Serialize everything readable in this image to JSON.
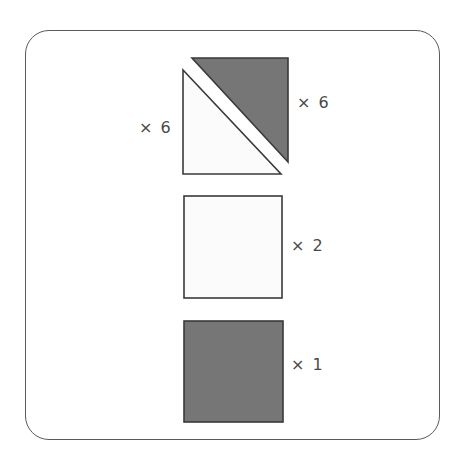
{
  "figure": {
    "frame": {
      "name": "rounded-panel",
      "border_color": "#5a5a5a",
      "background_color": "#ffffff",
      "corner_radius": 24
    },
    "colors": {
      "dark_fill": "#767676",
      "light_fill": "#fbfbfb",
      "outline": "#3a3a3a",
      "label_text": "#4a4a4a"
    },
    "rows": [
      {
        "id": "triangle-pair",
        "description": "square split along its diagonal into two right triangles",
        "shapes": [
          {
            "name": "light-triangle",
            "kind": "right-triangle",
            "orientation": "lower-left",
            "fill": "light",
            "multiplier_label": "× 6",
            "multiplier_value": 6,
            "label_position": "left"
          },
          {
            "name": "dark-triangle",
            "kind": "right-triangle",
            "orientation": "upper-right",
            "fill": "dark",
            "multiplier_label": "× 6",
            "multiplier_value": 6,
            "label_position": "right"
          }
        ]
      },
      {
        "id": "light-square",
        "description": "white square",
        "shapes": [
          {
            "name": "light-square",
            "kind": "square",
            "orientation": "upright",
            "fill": "light",
            "multiplier_label": "× 2",
            "multiplier_value": 2,
            "label_position": "right"
          }
        ]
      },
      {
        "id": "dark-square",
        "description": "dark gray square",
        "shapes": [
          {
            "name": "dark-square",
            "kind": "square",
            "orientation": "upright",
            "fill": "dark",
            "multiplier_label": "× 1",
            "multiplier_value": 1,
            "label_position": "right"
          }
        ]
      }
    ],
    "labels": {
      "triangle_left": "× 6",
      "triangle_right": "× 6",
      "square_light": "× 2",
      "square_dark": "× 1"
    }
  }
}
